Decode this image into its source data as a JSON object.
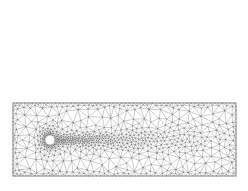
{
  "figure": {
    "type": "mesh-plot",
    "background_color": "#ffffff",
    "width": 248,
    "height": 191
  },
  "style": {
    "mesh_line_color": "#6a6a6a",
    "mesh_line_width": 0.35,
    "frame_color": "#8a8a8a",
    "frame_line_width": 0.8,
    "hole_fill_color": "#ffffff",
    "hole_stroke_color": "#9a9a9a",
    "dense_line_color": "#4a4a4a"
  },
  "panels": [
    {
      "id": "panel-top",
      "name": "upper-mesh-panel",
      "label": "",
      "frame": {
        "x": 13,
        "y": 10,
        "width": 223,
        "height": 74
      },
      "cylinder": {
        "cx": 48,
        "cy": 45,
        "r": 5.0
      },
      "refinement": {
        "wake_start_x": 48,
        "wake_end_x": 162,
        "wake_half_width_near": 13,
        "wake_half_width_far": 26,
        "min_spacing": 1.35,
        "max_spacing": 16.0,
        "near_body_spacing": 1.2,
        "boundary_layer_falloff": 34
      },
      "seed": 20417
    },
    {
      "id": "panel-bottom",
      "name": "lower-mesh-panel",
      "label": "",
      "frame": {
        "x": 13,
        "y": 103,
        "width": 223,
        "height": 73
      },
      "cylinder": {
        "cx": 50,
        "cy": 140,
        "r": 5.0
      },
      "refinement": {
        "wake_start_x": 50,
        "wake_end_x": 234,
        "wake_half_width_near": 13,
        "wake_half_width_far": 31,
        "min_spacing": 1.3,
        "max_spacing": 15.0,
        "near_body_spacing": 1.15,
        "boundary_layer_falloff": 40
      },
      "seed": 77341
    }
  ],
  "annotations": [
    {
      "id": "tick-mark-bottom",
      "name": "bottom-tick-mark",
      "text": "",
      "x": 137,
      "y": 183
    }
  ]
}
